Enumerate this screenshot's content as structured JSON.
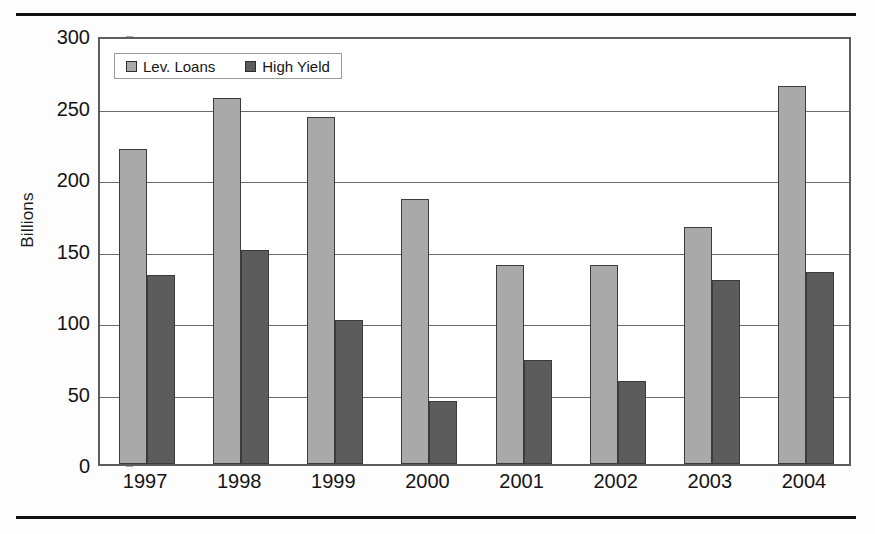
{
  "figure": {
    "y_axis_title": "Billions",
    "legend": {
      "entries": [
        {
          "label": "Lev. Loans",
          "color": "#a9a9a9"
        },
        {
          "label": "High Yield",
          "color": "#5c5c5c"
        }
      ]
    }
  },
  "chart_data": {
    "type": "bar",
    "title": "",
    "subtitle": "",
    "xlabel": "",
    "ylabel": "Billions",
    "ylim": [
      0,
      300
    ],
    "ytick_labels": [
      "0",
      "50",
      "100",
      "150",
      "200",
      "250",
      "300"
    ],
    "yticks": [
      0,
      50,
      100,
      150,
      200,
      250,
      300
    ],
    "grid": true,
    "legend_position": "inside top-left",
    "categories": [
      "1997",
      "1998",
      "1999",
      "2000",
      "2001",
      "2002",
      "2003",
      "2004"
    ],
    "series": [
      {
        "name": "Lev. Loans",
        "color": "#a9a9a9",
        "values": [
          220,
          256,
          243,
          185,
          139,
          139,
          166,
          264
        ]
      },
      {
        "name": "High Yield",
        "color": "#5c5c5c",
        "values": [
          132,
          150,
          101,
          44,
          73,
          58,
          129,
          134
        ]
      }
    ]
  }
}
